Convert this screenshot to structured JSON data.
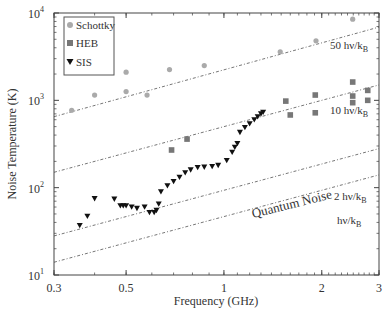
{
  "chart_data": {
    "type": "scatter",
    "title": "",
    "xlabel": "Frequency (GHz)",
    "ylabel": "Noise Temperature (K)",
    "xscale": "log",
    "yscale": "log",
    "xlim": [
      0.3,
      3
    ],
    "ylim": [
      10,
      10000
    ],
    "x_ticks": [
      {
        "value": 0.3,
        "label": "0.3"
      },
      {
        "value": 0.5,
        "label": "0.5"
      },
      {
        "value": 1,
        "label": "1"
      },
      {
        "value": 2,
        "label": "2"
      },
      {
        "value": 3,
        "label": "3"
      }
    ],
    "y_ticks": [
      {
        "value": 10,
        "base": "10",
        "exp": "1"
      },
      {
        "value": 100,
        "base": "10",
        "exp": "2"
      },
      {
        "value": 1000,
        "base": "10",
        "exp": "3"
      },
      {
        "value": 10000,
        "base": "10",
        "exp": "4"
      }
    ],
    "grid": false,
    "legend_position": "upper left",
    "series": [
      {
        "name": "Schottky",
        "marker": "circle",
        "color": "#aaaaaa",
        "points": [
          [
            0.34,
            770
          ],
          [
            0.4,
            1150
          ],
          [
            0.5,
            2100
          ],
          [
            0.5,
            1260
          ],
          [
            0.58,
            1150
          ],
          [
            0.68,
            2250
          ],
          [
            0.87,
            2500
          ],
          [
            1.49,
            3600
          ],
          [
            1.92,
            4800
          ],
          [
            2.49,
            8500
          ]
        ]
      },
      {
        "name": "HEB",
        "marker": "square",
        "color": "#777777",
        "points": [
          [
            0.69,
            270
          ],
          [
            0.77,
            360
          ],
          [
            1.55,
            980
          ],
          [
            1.6,
            680
          ],
          [
            1.91,
            1150
          ],
          [
            1.91,
            720
          ],
          [
            2.49,
            1620
          ],
          [
            2.49,
            1120
          ],
          [
            2.49,
            940
          ],
          [
            2.77,
            1300
          ],
          [
            2.77,
            1000
          ]
        ]
      },
      {
        "name": "SIS",
        "marker": "triangle-down",
        "color": "#111111",
        "points": [
          [
            0.36,
            37
          ],
          [
            0.38,
            47
          ],
          [
            0.4,
            75
          ],
          [
            0.46,
            74
          ],
          [
            0.48,
            62
          ],
          [
            0.49,
            62
          ],
          [
            0.5,
            62
          ],
          [
            0.52,
            60
          ],
          [
            0.54,
            58
          ],
          [
            0.57,
            60
          ],
          [
            0.59,
            52
          ],
          [
            0.61,
            52
          ],
          [
            0.62,
            55
          ],
          [
            0.63,
            65
          ],
          [
            0.64,
            90
          ],
          [
            0.67,
            105
          ],
          [
            0.7,
            118
          ],
          [
            0.73,
            132
          ],
          [
            0.76,
            148
          ],
          [
            0.79,
            160
          ],
          [
            0.83,
            170
          ],
          [
            0.87,
            172
          ],
          [
            0.92,
            175
          ],
          [
            0.96,
            180
          ],
          [
            1.02,
            205
          ],
          [
            1.06,
            255
          ],
          [
            1.08,
            290
          ],
          [
            1.1,
            320
          ],
          [
            1.12,
            430
          ],
          [
            1.16,
            490
          ],
          [
            1.2,
            540
          ],
          [
            1.24,
            600
          ],
          [
            1.27,
            650
          ],
          [
            1.3,
            700
          ],
          [
            1.32,
            730
          ]
        ]
      }
    ],
    "reference_lines": [
      {
        "label": "50 hν/kB",
        "label_main": "50 hν/k",
        "label_sub": "B",
        "x": [
          0.3,
          3
        ],
        "y": [
          650,
          6900
        ]
      },
      {
        "label": "10 hν/kB",
        "label_main": "10 hν/k",
        "label_sub": "B",
        "x": [
          0.3,
          3
        ],
        "y": [
          150,
          1500
        ]
      },
      {
        "label": "2 hν/kB",
        "label_main": "2 hν/k",
        "label_sub": "B",
        "x": [
          0.3,
          3
        ],
        "y": [
          28,
          280
        ]
      },
      {
        "label": "hν/kB",
        "label_main": "hν/k",
        "label_sub": "B",
        "x": [
          0.3,
          3
        ],
        "y": [
          14,
          140
        ]
      }
    ],
    "annotations": [
      {
        "text": "Quantum Noise",
        "x": 1.05,
        "y": 26,
        "rotation": -14
      }
    ]
  },
  "legend": {
    "items": [
      {
        "label": "Schottky"
      },
      {
        "label": "HEB"
      },
      {
        "label": "SIS"
      }
    ]
  }
}
